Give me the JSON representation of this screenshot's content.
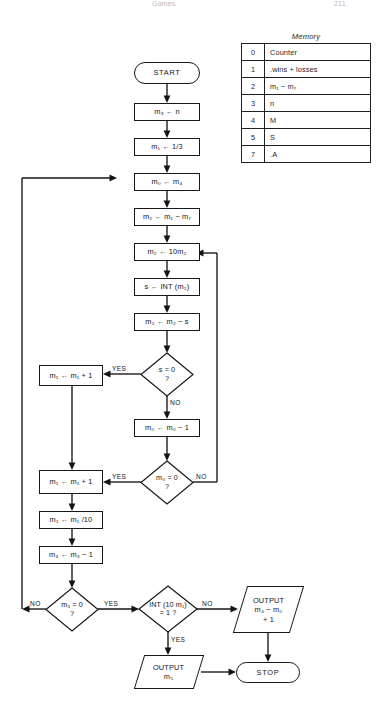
{
  "runhead": {
    "left": "Games",
    "right": "211"
  },
  "memory": {
    "caption": "Memory",
    "rows": [
      {
        "addr": "0",
        "desc": "Counter"
      },
      {
        "addr": "1",
        "desc": ".wins + losses"
      },
      {
        "addr": "2",
        "desc": "m₁ − m₇"
      },
      {
        "addr": "3",
        "desc": "n"
      },
      {
        "addr": "4",
        "desc": "M"
      },
      {
        "addr": "5",
        "desc": "S"
      },
      {
        "addr": "7",
        "desc": ".A"
      }
    ]
  },
  "flow": {
    "start": "START",
    "n1": "m₃ ← n",
    "n2": "m₁ ← 1/3",
    "n3": "m₀ ← m₄",
    "n4": "m₂ ← m₁ − m₇",
    "n5": "m₂ ← 10m₂",
    "n6": "s ← INT (m₂)",
    "n7": "m₂ ← m₂ − s",
    "n8": "m₁ ← m₁ + 1",
    "n9": "m₀ ← m₀ − 1",
    "n10": "m₁ ← m₁ + 1",
    "n11": "m₁ ← m₁ /10",
    "n12": "m₃ ← m₃ − 1",
    "d1_a": "s = 0",
    "d1_b": "?",
    "d2_a": "m₀ = 0",
    "d2_b": "?",
    "d3_a": "m₃ = 0",
    "d3_b": "?",
    "d4_a": "INT (10 m₁)",
    "d4_b": "= 1 ?",
    "out1_l1": "OUTPUT",
    "out1_l2": "m₄ − m₀",
    "out1_l3": "+ 1",
    "out2_l1": "OUTPUT",
    "out2_l2": "m₅",
    "stop": "STOP"
  },
  "edges": {
    "yes1": "YES",
    "no1": "NO",
    "yes2": "YES",
    "no2": "NO",
    "no3": "NO",
    "yes3": "YES",
    "no4": "NO",
    "yes4": "YES"
  },
  "colors": {
    "ink": "#141414",
    "rule": "#1f1f1f",
    "paper": "#ffffff",
    "runhead": "#b9b9bd"
  }
}
